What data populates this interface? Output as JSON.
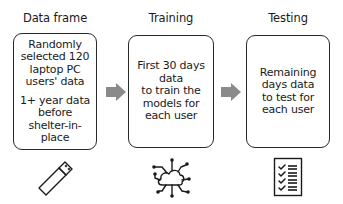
{
  "diagram": {
    "stages": [
      {
        "title": "Data frame",
        "paragraphs": [
          [
            "Randomly",
            "selected 120",
            "laptop PC",
            "users' data"
          ],
          [
            "1+ year data",
            "before",
            "shelter-in-",
            "place"
          ]
        ],
        "icon": "usb-drive-icon"
      },
      {
        "title": "Training",
        "paragraphs": [
          [
            "First 30 days",
            "data",
            "to train the",
            "models for",
            "each user"
          ]
        ],
        "icon": "cloud-network-icon"
      },
      {
        "title": "Testing",
        "paragraphs": [
          [
            "Remaining",
            "days data",
            "to test for",
            "each user"
          ]
        ],
        "icon": "checklist-icon"
      }
    ],
    "arrows": [
      {
        "from": "Data frame",
        "to": "Training"
      },
      {
        "from": "Training",
        "to": "Testing"
      }
    ],
    "colors": {
      "box_border": "#2a2a2a",
      "arrow": "#8a8a8a",
      "text": "#1a1a1a"
    }
  }
}
